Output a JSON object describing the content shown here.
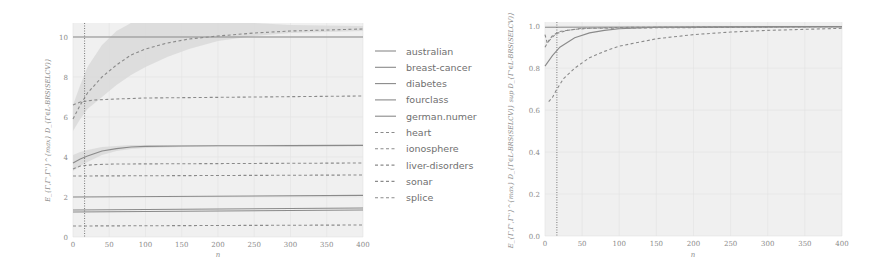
{
  "chart_data": [
    {
      "type": "line",
      "title": "",
      "xlabel": "n",
      "ylabel": "E_{Γ,Γ',Γ''}^{max} D_{Γ∈L-BRS(SELCV)}",
      "xlim": [
        0,
        400
      ],
      "ylim": [
        0,
        10.7
      ],
      "xticks": [
        0,
        50,
        100,
        150,
        200,
        250,
        300,
        350,
        400
      ],
      "yticks": [
        0,
        2,
        4,
        6,
        8,
        10
      ],
      "grid": true,
      "vline_x": 16,
      "legend_position": "right-outside",
      "series": [
        {
          "name": "australian",
          "style": "solid",
          "x": [
            0,
            400
          ],
          "values": [
            10.0,
            10.0
          ]
        },
        {
          "name": "breast-cancer",
          "style": "solid",
          "x": [
            0,
            400
          ],
          "values": [
            1.35,
            1.45
          ]
        },
        {
          "name": "diabetes",
          "style": "solid",
          "x": [
            0,
            10,
            20,
            40,
            60,
            80,
            100,
            150,
            200,
            300,
            400
          ],
          "values": [
            3.7,
            3.9,
            4.05,
            4.3,
            4.42,
            4.5,
            4.53,
            4.55,
            4.56,
            4.57,
            4.58
          ],
          "band": [
            [
              3.3,
              4.1
            ],
            [
              3.55,
              4.25
            ],
            [
              3.75,
              4.35
            ],
            [
              4.1,
              4.5
            ],
            [
              4.3,
              4.55
            ],
            [
              4.4,
              4.6
            ],
            [
              4.45,
              4.6
            ],
            [
              4.5,
              4.6
            ],
            [
              4.52,
              4.6
            ],
            [
              4.53,
              4.61
            ],
            [
              4.54,
              4.62
            ]
          ]
        },
        {
          "name": "fourclass",
          "style": "solid",
          "x": [
            0,
            400
          ],
          "values": [
            2.0,
            2.08
          ]
        },
        {
          "name": "german.numer",
          "style": "solid",
          "x": [
            0,
            400
          ],
          "values": [
            1.25,
            1.35
          ]
        },
        {
          "name": "heart",
          "style": "dashed",
          "x": [
            0,
            10,
            20,
            40,
            60,
            80,
            100,
            130,
            160,
            200,
            250,
            300,
            400
          ],
          "values": [
            5.9,
            6.6,
            7.2,
            8.0,
            8.6,
            9.1,
            9.4,
            9.7,
            9.9,
            10.05,
            10.2,
            10.3,
            10.4
          ],
          "band": [
            [
              5.3,
              6.6
            ],
            [
              5.9,
              7.6
            ],
            [
              6.4,
              8.5
            ],
            [
              7.0,
              9.6
            ],
            [
              7.6,
              10.3
            ],
            [
              8.1,
              10.7
            ],
            [
              8.5,
              10.7
            ],
            [
              9.0,
              10.7
            ],
            [
              9.4,
              10.7
            ],
            [
              9.8,
              10.7
            ],
            [
              10.05,
              10.7
            ],
            [
              10.2,
              10.6
            ],
            [
              10.3,
              10.55
            ]
          ]
        },
        {
          "name": "ionosphere",
          "style": "dashed",
          "x": [
            0,
            10,
            30,
            60,
            100,
            400
          ],
          "values": [
            6.6,
            6.75,
            6.85,
            6.9,
            6.95,
            7.05
          ]
        },
        {
          "name": "liver-disorders",
          "style": "dashed",
          "x": [
            0,
            10,
            30,
            60,
            400
          ],
          "values": [
            3.4,
            3.55,
            3.62,
            3.65,
            3.7
          ]
        },
        {
          "name": "sonar",
          "style": "dashed",
          "x": [
            0,
            400
          ],
          "values": [
            3.05,
            3.1
          ]
        },
        {
          "name": "splice",
          "style": "dashed",
          "x": [
            0,
            400
          ],
          "values": [
            0.55,
            0.6
          ]
        }
      ]
    },
    {
      "type": "line",
      "title": "",
      "xlabel": "n",
      "ylabel": "E_{Γ,Γ',Γ''}^{max} D_{Γ∈L-BRS(SELCV)} sup D_{Γ'∈L-BRS(SELCV)}",
      "xlim": [
        0,
        400
      ],
      "ylim": [
        0,
        1.02
      ],
      "xticks": [
        0,
        50,
        100,
        150,
        200,
        250,
        300,
        350,
        400
      ],
      "yticks": [
        0.0,
        0.2,
        0.4,
        0.6,
        0.8,
        1.0
      ],
      "grid": true,
      "vline_x": 16,
      "series": [
        {
          "name": "flat-solid",
          "style": "solid",
          "x": [
            0,
            400
          ],
          "values": [
            0.995,
            0.998
          ]
        },
        {
          "name": "solid-rising",
          "style": "solid",
          "x": [
            0,
            10,
            20,
            40,
            60,
            80,
            100,
            150,
            400
          ],
          "values": [
            0.81,
            0.86,
            0.9,
            0.945,
            0.968,
            0.98,
            0.988,
            0.995,
            0.998
          ]
        },
        {
          "name": "dashed-fast",
          "style": "dashed",
          "x": [
            0,
            5,
            10,
            20,
            40,
            60,
            100,
            400
          ],
          "values": [
            0.9,
            0.93,
            0.955,
            0.975,
            0.985,
            0.99,
            0.994,
            0.998
          ]
        },
        {
          "name": "dashed-slow",
          "style": "dashed",
          "x": [
            5,
            10,
            16,
            25,
            40,
            60,
            80,
            100,
            150,
            200,
            250,
            300,
            400
          ],
          "values": [
            0.64,
            0.66,
            0.7,
            0.75,
            0.8,
            0.85,
            0.88,
            0.905,
            0.94,
            0.96,
            0.972,
            0.98,
            0.99
          ]
        },
        {
          "name": "dashed-mid",
          "style": "dashed",
          "x": [
            0,
            3,
            8,
            15,
            30,
            50,
            400
          ],
          "values": [
            0.96,
            0.92,
            0.94,
            0.965,
            0.98,
            0.99,
            0.998
          ]
        }
      ]
    }
  ],
  "legend": {
    "items": [
      {
        "label": "australian",
        "style": "solid"
      },
      {
        "label": "breast-cancer",
        "style": "solid"
      },
      {
        "label": "diabetes",
        "style": "solid"
      },
      {
        "label": "fourclass",
        "style": "solid"
      },
      {
        "label": "german.numer",
        "style": "solid"
      },
      {
        "label": "heart",
        "style": "dashed"
      },
      {
        "label": "ionosphere",
        "style": "dashed"
      },
      {
        "label": "liver-disorders",
        "style": "dashed"
      },
      {
        "label": "sonar",
        "style": "dashed"
      },
      {
        "label": "splice",
        "style": "dashed"
      }
    ]
  },
  "colors": {
    "line": "#8a8a8a",
    "band": "#d9d9d9",
    "plot_bg": "#f0f0f0",
    "grid": "#e2e2e2",
    "vline": "#777777"
  }
}
